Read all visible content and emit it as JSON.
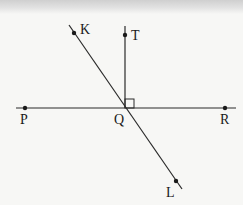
{
  "diagram": {
    "type": "geometry",
    "line_color": "#2a2a2a",
    "background": "#f7f7f5",
    "points": [
      {
        "id": "K",
        "label": "K",
        "x": 74,
        "y": 33,
        "label_x": 80,
        "label_y": 34
      },
      {
        "id": "T",
        "label": "T",
        "x": 125,
        "y": 35,
        "label_x": 131,
        "label_y": 40
      },
      {
        "id": "P",
        "label": "P",
        "x": 25,
        "y": 108,
        "label_x": 20,
        "label_y": 124
      },
      {
        "id": "Q",
        "label": "Q",
        "x": 125,
        "y": 108,
        "label_x": 114,
        "label_y": 124
      },
      {
        "id": "R",
        "label": "R",
        "x": 225,
        "y": 108,
        "label_x": 220,
        "label_y": 124
      },
      {
        "id": "L",
        "label": "L",
        "x": 176,
        "y": 181,
        "label_x": 166,
        "label_y": 197
      }
    ],
    "lines": [
      {
        "id": "line-PR",
        "kind": "line",
        "through": [
          "P",
          "Q",
          "R"
        ],
        "x1": 16,
        "y1": 108,
        "x2": 236,
        "y2": 108
      },
      {
        "id": "line-KL",
        "kind": "line",
        "through": [
          "K",
          "Q",
          "L"
        ],
        "x1": 69,
        "y1": 25,
        "x2": 182,
        "y2": 189
      },
      {
        "id": "ray-QT",
        "kind": "ray",
        "from": "Q",
        "through": "T",
        "x1": 125,
        "y1": 108,
        "x2": 125,
        "y2": 26
      }
    ],
    "right_angle": {
      "vertex": "Q",
      "between": [
        "T",
        "R"
      ],
      "x": 125,
      "y": 99,
      "size": 9
    },
    "labels": {
      "K": "K",
      "T": "T",
      "P": "P",
      "Q": "Q",
      "R": "R",
      "L": "L"
    }
  }
}
